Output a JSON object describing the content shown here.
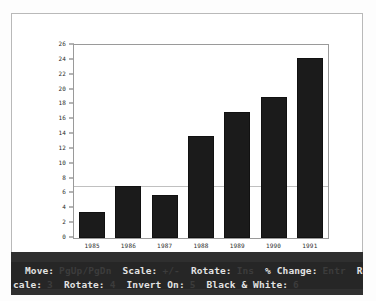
{
  "window": {
    "background_color": "#ffffff",
    "frame_color": "#b9b9b9"
  },
  "chart_data": {
    "type": "bar",
    "title": "",
    "subtitle": "",
    "xlabel": "",
    "ylabel": "",
    "categories": [
      "1985",
      "1986",
      "1987",
      "1988",
      "1989",
      "1990",
      "1991"
    ],
    "values": [
      3.5,
      7.0,
      5.8,
      13.8,
      17.0,
      19.0,
      24.2
    ],
    "series": [
      {
        "name": "",
        "values": [
          3.5,
          7.0,
          5.8,
          13.8,
          17.0,
          19.0,
          24.2
        ]
      }
    ],
    "ylim": [
      0,
      26
    ],
    "ytick_labels": [
      "0",
      "2",
      "4",
      "6",
      "8",
      "10",
      "12",
      "14",
      "16",
      "18",
      "20",
      "22",
      "24",
      "26"
    ],
    "ytick_values": [
      0,
      2,
      4,
      6,
      8,
      10,
      12,
      14,
      16,
      18,
      20,
      22,
      24,
      26
    ],
    "grid": false,
    "legend": "none",
    "bar_color": "#1b1b1b",
    "plot_background": "#ffffff",
    "axis_color": "#9a9a9a"
  },
  "status_bar": {
    "background_color": "#262626",
    "label_color": "#e2e2e2",
    "key_color": "#3c3c3c",
    "line1": [
      {
        "label": "Move:",
        "key": "PgUp/PgDn"
      },
      {
        "label": "Scale:",
        "key": "+/-"
      },
      {
        "label": "Rotate:",
        "key": "Ins"
      },
      {
        "label": "% Change:",
        "key": "Entr"
      },
      {
        "label": "Reset",
        "key": ""
      }
    ],
    "line2": [
      {
        "label": "cale:",
        "key": "3"
      },
      {
        "label": "Rotate:",
        "key": "4"
      },
      {
        "label": "Invert On:",
        "key": "5"
      },
      {
        "label": "Black & White:",
        "key": "6"
      }
    ]
  }
}
